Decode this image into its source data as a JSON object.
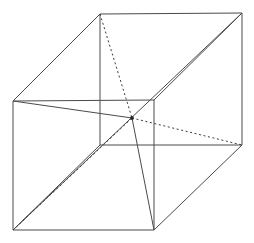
{
  "figure": {
    "type": "line-drawing",
    "width": 254,
    "height": 243,
    "background_color": "#ffffff",
    "stroke_color_solid": "#4a4a4a",
    "stroke_color_dashed": "#3a3a3a",
    "stroke_width": 1,
    "projection": "oblique",
    "depth_offset": {
      "dx": 88,
      "dy": -87
    }
  },
  "chart_data": {
    "type": "line",
    "xlabel": "",
    "ylabel": "",
    "grid": false,
    "legend": "none",
    "xlim": [
      0,
      254
    ],
    "ylim": [
      0,
      243
    ],
    "vertices": {
      "front_top_left": [
        13,
        101
      ],
      "front_top_right": [
        154,
        100
      ],
      "front_bottom_left": [
        13,
        230
      ],
      "front_bottom_right": [
        154,
        230
      ],
      "back_top_left": [
        100,
        14
      ],
      "back_top_right": [
        242,
        13
      ],
      "back_bottom_left": [
        100,
        145
      ],
      "back_bottom_right": [
        242,
        145
      ],
      "center_node": [
        132,
        118
      ]
    },
    "series": [
      {
        "name": "front-face-top-edge",
        "style": "solid",
        "x": [
          13,
          154
        ],
        "y": [
          101,
          100
        ]
      },
      {
        "name": "front-face-left-edge",
        "style": "solid",
        "x": [
          13,
          13
        ],
        "y": [
          101,
          230
        ]
      },
      {
        "name": "front-face-bottom-edge",
        "style": "solid",
        "x": [
          13,
          154
        ],
        "y": [
          230,
          230
        ]
      },
      {
        "name": "front-face-right-edge",
        "style": "solid",
        "x": [
          154,
          154
        ],
        "y": [
          100,
          230
        ]
      },
      {
        "name": "back-face-top-edge",
        "style": "solid",
        "x": [
          100,
          242
        ],
        "y": [
          14,
          13
        ]
      },
      {
        "name": "back-face-left-edge",
        "style": "solid",
        "x": [
          100,
          100
        ],
        "y": [
          14,
          145
        ]
      },
      {
        "name": "back-face-bottom-edge",
        "style": "solid",
        "x": [
          100,
          242
        ],
        "y": [
          145,
          145
        ]
      },
      {
        "name": "back-face-right-edge",
        "style": "solid",
        "x": [
          242,
          242
        ],
        "y": [
          13,
          145
        ]
      },
      {
        "name": "connector-top-left",
        "style": "solid",
        "x": [
          13,
          100
        ],
        "y": [
          101,
          14
        ]
      },
      {
        "name": "connector-top-right",
        "style": "solid",
        "x": [
          154,
          242
        ],
        "y": [
          100,
          13
        ]
      },
      {
        "name": "connector-bottom-left",
        "style": "solid",
        "x": [
          13,
          100
        ],
        "y": [
          230,
          145
        ]
      },
      {
        "name": "connector-bottom-right",
        "style": "solid",
        "x": [
          154,
          242
        ],
        "y": [
          230,
          145
        ]
      },
      {
        "name": "space-diagonal-front-bottom-left-to-back-top-right",
        "style": "solid",
        "x": [
          13,
          242
        ],
        "y": [
          230,
          13
        ]
      },
      {
        "name": "diagonal-front-top-left-to-center",
        "style": "solid",
        "x": [
          13,
          132
        ],
        "y": [
          101,
          118
        ]
      },
      {
        "name": "diagonal-center-to-front-bottom-right",
        "style": "solid",
        "x": [
          132,
          154
        ],
        "y": [
          118,
          230
        ]
      },
      {
        "name": "diagonal-back-top-left-to-center",
        "style": "dashed",
        "x": [
          100,
          132
        ],
        "y": [
          14,
          118
        ]
      },
      {
        "name": "diagonal-center-to-back-bottom-right",
        "style": "dashed",
        "x": [
          132,
          242
        ],
        "y": [
          118,
          145
        ]
      },
      {
        "name": "diagonal-front-bottom-left-to-center",
        "style": "dashed",
        "x": [
          13,
          132
        ],
        "y": [
          230,
          118
        ]
      }
    ],
    "nodes": [
      {
        "name": "center-intersection",
        "x": 132,
        "y": 118,
        "radius": 1.9
      }
    ]
  }
}
